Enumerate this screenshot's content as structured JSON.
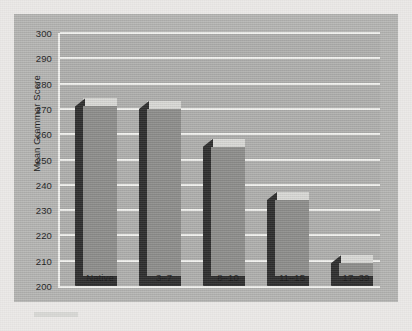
{
  "figure": {
    "background_color": "#b6b6b4",
    "plot_background_color": "#b0b0ae",
    "gridline_color": "#f2f2ef",
    "bar_front_color": "#8e8e8c",
    "bar_side_color": "#2e2e2e",
    "bar_top_color": "#d9d9d6"
  },
  "chart_data": {
    "type": "bar",
    "title": "",
    "xlabel": "Age of Arrival",
    "ylabel": "Mean Grammar Score",
    "categories": [
      "Native",
      "3–7",
      "8–10",
      "11–15",
      "17–39"
    ],
    "values": [
      271,
      270,
      255,
      234,
      209
    ],
    "ylim": [
      200,
      300
    ],
    "yticks": [
      200,
      210,
      220,
      230,
      240,
      250,
      260,
      270,
      280,
      290,
      300
    ],
    "ytick_labels": [
      "200",
      "210",
      "220",
      "230",
      "240",
      "250",
      "260",
      "270",
      "280",
      "290",
      "300"
    ],
    "grid": true,
    "grid_axis": "y",
    "legend": null,
    "series": [
      {
        "name": "Mean Grammar Score",
        "values": [
          271,
          270,
          255,
          234,
          209
        ]
      }
    ],
    "style": "3d-bar",
    "annotations": []
  }
}
